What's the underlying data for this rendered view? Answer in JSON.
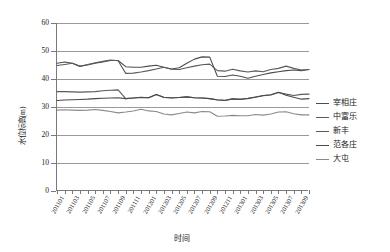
{
  "chart_data": {
    "type": "line",
    "title": "",
    "xlabel": "时间",
    "ylabel": "水位标高(m)",
    "ylim": [
      0,
      60
    ],
    "yticks": [
      0,
      10,
      20,
      30,
      40,
      50,
      60
    ],
    "grid": true,
    "legend_position": "right",
    "categories": [
      "201101",
      "201102",
      "201103",
      "201104",
      "201105",
      "201106",
      "201107",
      "201108",
      "201109",
      "201110",
      "201111",
      "201112",
      "201201",
      "201202",
      "201203",
      "201204",
      "201205",
      "201206",
      "201207",
      "201208",
      "201209",
      "201210",
      "201211",
      "201212",
      "201301",
      "201302",
      "201303",
      "201304",
      "201305",
      "201306",
      "201307",
      "201308",
      "201309",
      "201310"
    ],
    "tick_labels": [
      "201101",
      "201103",
      "201105",
      "201107",
      "201109",
      "201111",
      "201201",
      "201203",
      "201205",
      "201207",
      "201209",
      "201211",
      "201301",
      "201303",
      "201305",
      "201307",
      "201309"
    ],
    "series": [
      {
        "name": "宰相庄",
        "color": "#4d4d4d",
        "values": [
          45.6,
          46.1,
          45.6,
          44.6,
          45.0,
          45.6,
          46.1,
          46.6,
          46.6,
          44.4,
          44.2,
          44.2,
          44.6,
          44.9,
          44.2,
          43.6,
          44.0,
          45.6,
          47.1,
          47.9,
          47.8,
          41.0,
          40.9,
          41.4,
          41.0,
          40.3,
          41.0,
          41.6,
          42.2,
          42.6,
          43.0,
          43.2,
          43.0,
          43.4
        ]
      },
      {
        "name": "中富乐",
        "color": "#5a5a5a",
        "values": [
          44.8,
          45.2,
          45.6,
          44.5,
          45.2,
          45.8,
          46.3,
          46.8,
          46.5,
          42.0,
          42.1,
          42.5,
          43.0,
          43.6,
          44.2,
          43.5,
          43.4,
          44.0,
          44.6,
          45.1,
          45.3,
          43.0,
          42.8,
          43.5,
          42.9,
          42.5,
          42.9,
          42.6,
          43.4,
          43.8,
          44.6,
          43.8,
          43.2,
          43.4
        ]
      },
      {
        "name": "新丰",
        "color": "#595959",
        "values": [
          35.5,
          35.5,
          35.4,
          35.3,
          35.4,
          35.5,
          35.8,
          36.0,
          36.1,
          33.0,
          33.2,
          33.4,
          33.3,
          34.5,
          33.5,
          33.3,
          33.4,
          33.6,
          33.3,
          33.2,
          33.0,
          32.6,
          32.4,
          32.9,
          32.8,
          33.0,
          33.5,
          34.0,
          34.3,
          35.2,
          34.6,
          34.1,
          34.5,
          34.6
        ]
      },
      {
        "name": "范各庄",
        "color": "#4a4a4a",
        "values": [
          32.3,
          32.5,
          32.6,
          32.7,
          32.8,
          33.0,
          33.1,
          33.2,
          33.3,
          33.0,
          33.2,
          33.5,
          33.3,
          34.5,
          33.4,
          33.2,
          33.4,
          33.6,
          33.3,
          33.2,
          33.0,
          32.5,
          32.3,
          32.9,
          32.7,
          33.1,
          33.6,
          34.1,
          34.4,
          35.3,
          34.2,
          33.5,
          32.8,
          33.0
        ]
      },
      {
        "name": "大屯",
        "color": "#8a8a8a",
        "values": [
          28.9,
          29.0,
          28.9,
          28.8,
          28.9,
          29.1,
          28.8,
          28.4,
          27.9,
          28.2,
          28.6,
          29.2,
          28.6,
          28.4,
          27.5,
          27.2,
          27.7,
          28.2,
          27.9,
          28.4,
          28.3,
          26.7,
          26.8,
          27.0,
          26.9,
          26.9,
          27.3,
          27.1,
          27.5,
          28.2,
          28.3,
          27.6,
          27.2,
          27.2
        ]
      }
    ]
  }
}
